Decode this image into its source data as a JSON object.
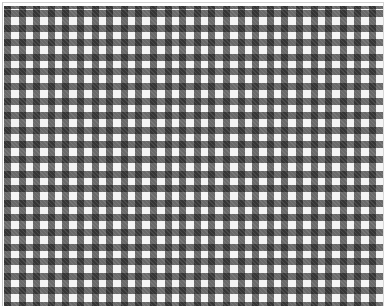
{
  "image": {
    "subject": "gingham check fabric pattern",
    "colors": {
      "background": "#ffffff",
      "light_square": "#f4f4f4",
      "mid_square": "#7f7f7f",
      "dark_square": "#1c1c1c",
      "border": "#c8c8c8"
    },
    "pattern": {
      "type": "gingham",
      "period_px": 14.6,
      "band_px": 7
    }
  }
}
